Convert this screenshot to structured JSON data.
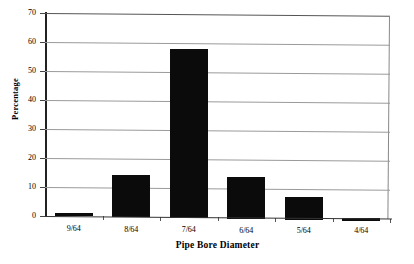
{
  "chart_data": {
    "type": "bar",
    "title": "",
    "subtitle": "",
    "xlabel": "Pipe Bore Diameter",
    "ylabel": "Percentage",
    "categories": [
      "9/64",
      "8/64",
      "7/64",
      "6/64",
      "5/64",
      "4/64"
    ],
    "values": [
      1,
      14.3,
      58,
      14,
      7.3,
      0.3
    ],
    "series": [
      {
        "name": "Percentage",
        "values": [
          1,
          14.3,
          58,
          14,
          7.3,
          0.3
        ]
      }
    ],
    "ylim": [
      0,
      70
    ],
    "ytick_labels": [
      "0",
      "10",
      "20",
      "30",
      "40",
      "50",
      "60",
      "70"
    ],
    "ytick_values": [
      0,
      10,
      20,
      30,
      40,
      50,
      60,
      70
    ],
    "grid": "horizontal",
    "legend": "none",
    "bar_color": "#0b0b0b",
    "gridline_color": "#9a9a9a",
    "axis_color": "#222222",
    "background_color": "#ffffff",
    "annotations": []
  },
  "axes": {
    "y_title": "Percentage",
    "x_title": "Pipe Bore Diameter"
  }
}
